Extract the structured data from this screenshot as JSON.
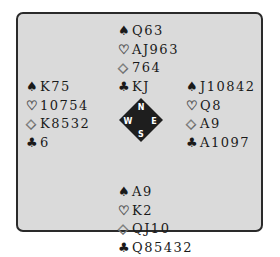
{
  "deal": {
    "north": {
      "spades": "Q63",
      "hearts": "AJ963",
      "diamonds": "764",
      "clubs": "KJ"
    },
    "west": {
      "spades": "K75",
      "hearts": "10754",
      "diamonds": "K8532",
      "clubs": "6"
    },
    "east": {
      "spades": "J10842",
      "hearts": "Q8",
      "diamonds": "A9",
      "clubs": "A1097"
    },
    "south": {
      "spades": "A9",
      "hearts": "K2",
      "diamonds": "QJ10",
      "clubs": "Q85432"
    }
  },
  "compass": {
    "n": "N",
    "s": "S",
    "e": "E",
    "w": "W"
  },
  "suits": {
    "spade": "♠",
    "heart": "♡",
    "diamond": "◇",
    "club": "♣"
  },
  "colors": {
    "background": "#dadada",
    "border": "#2a2a2a",
    "compass_fill": "#1e1e1e",
    "compass_text": "#ffffff"
  }
}
